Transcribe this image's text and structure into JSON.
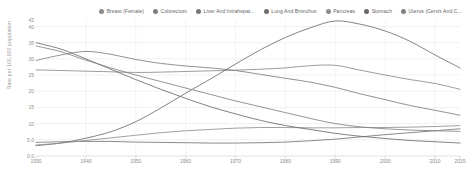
{
  "chart_data": {
    "type": "line",
    "title": "",
    "xlabel": "",
    "ylabel": "Rate per 100,000 population",
    "xlim": [
      1930,
      2015
    ],
    "ylim": [
      0,
      42
    ],
    "grid": true,
    "legend_position": "top-right",
    "xtick_labels": [
      "1930",
      "1940",
      "1950",
      "1960",
      "1970",
      "1980",
      "1990",
      "2000",
      "2010",
      "2015"
    ],
    "xtick_values": [
      1930,
      1940,
      1950,
      1960,
      1970,
      1980,
      1990,
      2000,
      2010,
      2015
    ],
    "ytick_labels": [
      "42",
      "40",
      "35",
      "30",
      "25",
      "20",
      "15",
      "10",
      "5.0",
      "0.0"
    ],
    "ytick_values": [
      42,
      40,
      35,
      30,
      25,
      20,
      15,
      10,
      5,
      0
    ],
    "x": [
      1930,
      1935,
      1940,
      1945,
      1950,
      1955,
      1960,
      1965,
      1970,
      1975,
      1980,
      1985,
      1990,
      1995,
      2000,
      2005,
      2010,
      2015
    ],
    "series": [
      {
        "name": "Breast (Female)",
        "color": "#8a8a8a",
        "values": [
          26.6,
          26.4,
          26.2,
          26.0,
          25.8,
          25.9,
          26.1,
          26.3,
          26.5,
          26.8,
          27.2,
          27.9,
          28.0,
          26.5,
          25.0,
          23.6,
          22.4,
          20.6
        ]
      },
      {
        "name": "Colorectum",
        "color": "#7e7e7e",
        "values": [
          29.5,
          31.2,
          32.3,
          31.4,
          29.8,
          28.6,
          27.8,
          27.2,
          26.4,
          25.2,
          24.0,
          22.8,
          21.2,
          19.2,
          17.4,
          15.6,
          14.1,
          12.6
        ]
      },
      {
        "name": "Liver And Intrahepat...",
        "color": "#757575",
        "values": [
          4.2,
          4.4,
          4.5,
          4.5,
          4.3,
          4.2,
          4.1,
          4.0,
          4.0,
          4.1,
          4.3,
          4.7,
          5.2,
          5.9,
          6.6,
          7.2,
          7.8,
          8.4
        ]
      },
      {
        "name": "Lung And Bronchus",
        "color": "#6d6d6d",
        "values": [
          3.2,
          4.0,
          5.5,
          7.5,
          10.6,
          14.8,
          19.4,
          23.8,
          28.4,
          32.8,
          36.6,
          39.6,
          41.7,
          40.7,
          38.6,
          35.4,
          31.2,
          27.2
        ]
      },
      {
        "name": "Pancreas",
        "color": "#8f8f8f",
        "values": [
          3.4,
          4.0,
          4.8,
          5.6,
          6.4,
          7.2,
          7.8,
          8.2,
          8.6,
          8.8,
          8.8,
          8.7,
          8.7,
          8.8,
          8.8,
          8.9,
          9.1,
          9.4
        ]
      },
      {
        "name": "Stomach",
        "color": "#6a6a6a",
        "values": [
          35.0,
          33.0,
          30.0,
          26.8,
          23.6,
          20.6,
          17.8,
          15.2,
          13.0,
          11.0,
          9.4,
          8.2,
          7.0,
          6.1,
          5.4,
          4.8,
          4.4,
          4.0
        ]
      },
      {
        "name": "Uterus (Cervix And C...",
        "color": "#828282",
        "values": [
          34.0,
          32.2,
          29.6,
          27.2,
          25.0,
          23.0,
          21.0,
          19.0,
          17.0,
          15.2,
          13.4,
          11.6,
          10.0,
          9.0,
          8.4,
          8.0,
          7.8,
          7.6
        ]
      }
    ]
  },
  "legend": {
    "items": [
      {
        "label": "Breast (Female)"
      },
      {
        "label": "Colorectum"
      },
      {
        "label": "Liver And Intrahepat..."
      },
      {
        "label": "Lung And Bronchus"
      },
      {
        "label": "Pancreas"
      },
      {
        "label": "Stomach"
      },
      {
        "label": "Uterus (Cervix And C..."
      }
    ]
  },
  "axes": {
    "y_title": "Rate per 100,000 population"
  }
}
